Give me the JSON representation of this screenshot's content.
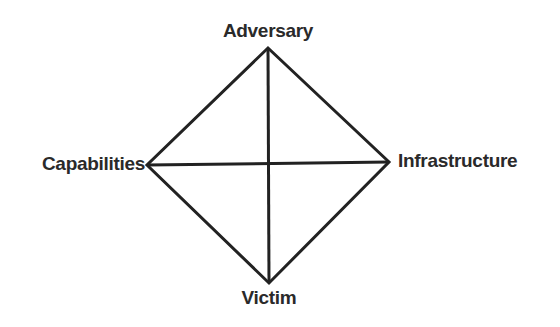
{
  "diagram": {
    "nodes": {
      "top": "Adversary",
      "left": "Capabilities",
      "right": "Infrastructure",
      "bottom": "Victim"
    },
    "edges": [
      [
        "Adversary",
        "Infrastructure"
      ],
      [
        "Infrastructure",
        "Victim"
      ],
      [
        "Victim",
        "Capabilities"
      ],
      [
        "Capabilities",
        "Adversary"
      ],
      [
        "Adversary",
        "Victim"
      ],
      [
        "Capabilities",
        "Infrastructure"
      ]
    ],
    "line_color": "#222222",
    "text_color": "#2a2a2a"
  }
}
